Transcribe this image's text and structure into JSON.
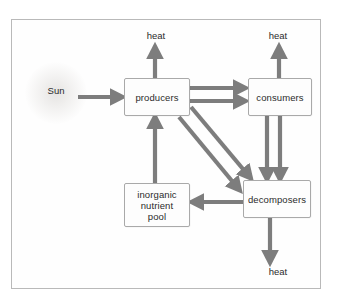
{
  "diagram": {
    "background_color": "#ffffff",
    "frame_border_color": "#b9b9b9",
    "arrow_color": "#7d7d7d",
    "box_border_color": "#a9a9a9",
    "box_fill_color": "#fdfdfd",
    "text_color": "#2b2b2b"
  },
  "nodes": [
    {
      "id": "producers",
      "label": "producers"
    },
    {
      "id": "consumers",
      "label": "consumers"
    },
    {
      "id": "decomposers",
      "label": "decomposers"
    },
    {
      "id": "pool",
      "label": "inorganic\nnutrient\npool"
    }
  ],
  "labels": {
    "sun": "Sun",
    "heat_producers": "heat",
    "heat_consumers": "heat",
    "heat_decomposers": "heat"
  },
  "flows": [
    {
      "from": "Sun",
      "to": "producers",
      "direction": "right"
    },
    {
      "from": "producers",
      "to": "heat",
      "direction": "up"
    },
    {
      "from": "producers",
      "to": "consumers",
      "direction": "right"
    },
    {
      "from": "producers",
      "to": "consumers",
      "direction": "right"
    },
    {
      "from": "producers",
      "to": "decomposers",
      "direction": "diagonal-down-right"
    },
    {
      "from": "producers",
      "to": "decomposers",
      "direction": "diagonal-down-right"
    },
    {
      "from": "consumers",
      "to": "heat",
      "direction": "up"
    },
    {
      "from": "consumers",
      "to": "decomposers",
      "direction": "down"
    },
    {
      "from": "consumers",
      "to": "decomposers",
      "direction": "down"
    },
    {
      "from": "decomposers",
      "to": "heat",
      "direction": "down"
    },
    {
      "from": "decomposers",
      "to": "pool",
      "direction": "left"
    },
    {
      "from": "pool",
      "to": "producers",
      "direction": "up"
    }
  ]
}
